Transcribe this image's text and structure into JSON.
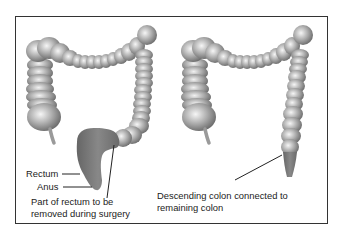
{
  "diagram": {
    "title": "",
    "panels": [
      {
        "id": "before",
        "description": "Colon with rectum highlighted",
        "labels": {
          "rectum": "Rectum",
          "anus": "Anus",
          "removed_line1": "Part of rectum to be",
          "removed_line2": "removed during surgery"
        }
      },
      {
        "id": "after",
        "description": "Colon after surgery",
        "labels": {
          "connected_line1": "Descending colon connected to",
          "connected_line2": "remaining colon"
        }
      }
    ],
    "colors": {
      "frame": "#333333",
      "colon_light": "#e6e6e6",
      "colon_mid": "#a8a8a8",
      "colon_dark": "#6e6e6e",
      "rectum": "#7a7a7a",
      "leader_line": "#222222",
      "text": "#222222"
    }
  }
}
